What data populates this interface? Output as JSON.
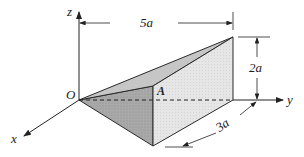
{
  "figure": {
    "type": "3d-wedge-prism",
    "axes": {
      "x_label": "x",
      "y_label": "y",
      "z_label": "z"
    },
    "points": {
      "origin_label": "O",
      "vertex_label": "A"
    },
    "dimensions": {
      "length": "5a",
      "height": "2a",
      "depth": "3a"
    },
    "colors": {
      "front_face": "#a8a8a8",
      "top_face": "#c8c8c8",
      "side_face": "#e4e4e4",
      "outline": "#2a2a2a"
    }
  }
}
